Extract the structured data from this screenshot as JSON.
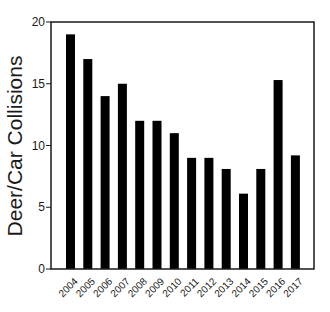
{
  "chart_data": {
    "type": "bar",
    "title": "",
    "xlabel": "",
    "ylabel": "Deer/Car Collisions",
    "categories": [
      "2004",
      "2005",
      "2006",
      "2007",
      "2008",
      "2009",
      "2010",
      "2011",
      "2012",
      "2013",
      "2014",
      "2015",
      "2016",
      "2017"
    ],
    "values": [
      19,
      17,
      14,
      15,
      12,
      12,
      11,
      9,
      9,
      8.1,
      6.1,
      8.1,
      15.3,
      9.2
    ],
    "ylim": [
      0,
      20
    ],
    "yticks": [
      0,
      5,
      10,
      15,
      20
    ],
    "grid": false,
    "legend": null,
    "bar_color": "#000000",
    "frame_color": "#1a1a1a"
  }
}
